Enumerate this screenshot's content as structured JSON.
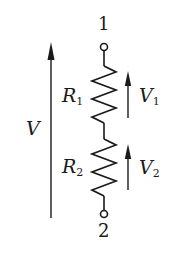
{
  "diagram": {
    "type": "series resistor voltage divider",
    "colors": {
      "stroke": "#1a1a1a",
      "background": "#ffffff"
    },
    "terminals": [
      {
        "id": "top",
        "label": "1"
      },
      {
        "id": "bottom",
        "label": "2"
      }
    ],
    "resistors": [
      {
        "id": "R1",
        "symbol": "R",
        "subscript": "1"
      },
      {
        "id": "R2",
        "symbol": "R",
        "subscript": "2"
      }
    ],
    "voltages": [
      {
        "id": "V",
        "symbol": "V",
        "subscript": "",
        "direction": "up",
        "spans": "terminal 2 to terminal 1"
      },
      {
        "id": "V1",
        "symbol": "V",
        "subscript": "1",
        "direction": "up",
        "spans": "R1"
      },
      {
        "id": "V2",
        "symbol": "V",
        "subscript": "2",
        "direction": "up",
        "spans": "R2"
      }
    ]
  }
}
